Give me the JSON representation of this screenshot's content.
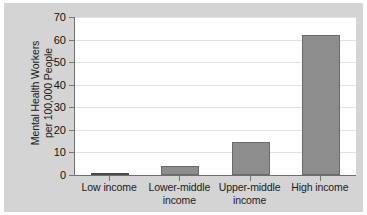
{
  "chart_data": {
    "type": "bar",
    "title": "",
    "xlabel": "",
    "ylabel_line1": "Mental Health Workers",
    "ylabel_line2": "per 100,000 People",
    "categories": [
      "Low income",
      "Lower-middle income",
      "Upper-middle income",
      "High income"
    ],
    "category_lines": [
      [
        "Low income"
      ],
      [
        "Lower-middle",
        "income"
      ],
      [
        "Upper-middle",
        "income"
      ],
      [
        "High income"
      ]
    ],
    "values": [
      1,
      4,
      14.5,
      62
    ],
    "ylim": [
      0,
      70
    ],
    "yticks": [
      0,
      10,
      20,
      30,
      40,
      50,
      60,
      70
    ],
    "ytick_labels": [
      "0",
      "10",
      "20",
      "30",
      "40",
      "50",
      "60",
      "70"
    ],
    "grid": true,
    "legend": false,
    "bar_color": "#8d8d8d",
    "bar_edge_color": "#6a6a6a",
    "plot_background": "#ffffff",
    "figure_background": "#d4d4d4",
    "axis_color": "#6f6f6f",
    "gridline_color": "#e2e2e2"
  }
}
